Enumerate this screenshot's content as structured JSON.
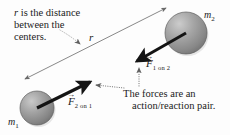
{
  "figure": {
    "background_color": "#fdfdfd",
    "width": 230,
    "height": 135
  },
  "captions": {
    "distance": {
      "line1_italic": "r",
      "line1_rest": " is the distance",
      "line2": "between the",
      "line3": "centers."
    },
    "action_reaction": {
      "line1": "The forces are an",
      "line2": "action/reaction pair."
    }
  },
  "labels": {
    "mass1": "m",
    "mass1_sub": "1",
    "mass2": "m",
    "mass2_sub": "2",
    "distance_symbol": "r",
    "force_on_1": "F",
    "force_on_1_sub": "2 on 1",
    "force_on_2": "F",
    "force_on_2_sub": "1 on 2",
    "vector_arrow": "→"
  },
  "colors": {
    "sphere_fill": "#9a9a9a",
    "sphere_highlight": "#c9c9c9",
    "sphere_shadow": "#6f6f6f",
    "sphere_outline": "#5a5a5a",
    "force_arrow": "#141414",
    "distance_line": "#6a6a6a",
    "leader_line": "#7a7a7a",
    "text": "#1b1b1b"
  },
  "geometry": {
    "sphere1": {
      "cx": 37,
      "cy": 108,
      "r": 17
    },
    "sphere2": {
      "cx": 186,
      "cy": 33,
      "r": 21
    },
    "distance_line": {
      "x1": 25,
      "y1": 79,
      "x2": 166,
      "y2": 8
    },
    "force_arrow_1": {
      "x1": 37,
      "y1": 108,
      "x2": 92,
      "y2": 81
    },
    "force_arrow_2": {
      "x1": 186,
      "y1": 33,
      "x2": 135,
      "y2": 62
    }
  }
}
